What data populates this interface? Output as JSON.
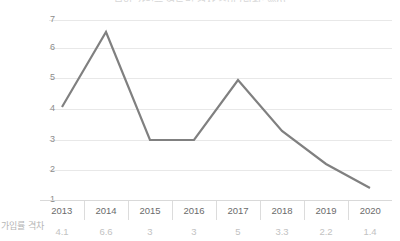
{
  "chart_data": {
    "type": "line",
    "title": "보험 가입률 연도별 격차 추이 (단위: %p)",
    "xlabel": "",
    "ylabel": "",
    "categories": [
      "2013",
      "2014",
      "2015",
      "2016",
      "2017",
      "2018",
      "2019",
      "2020"
    ],
    "series": [
      {
        "name": "가입률 격차",
        "values": [
          4.1,
          6.6,
          3,
          3,
          5,
          3.3,
          2.2,
          1.4
        ]
      }
    ],
    "value_labels": [
      "4.1",
      "6.6",
      "3",
      "3",
      "5",
      "3.3",
      "2.2",
      "1.4"
    ],
    "ylim": [
      1,
      7
    ],
    "yticks": [
      "7",
      "6",
      "5",
      "4",
      "3",
      "2",
      "1"
    ],
    "grid": true,
    "legend": "none",
    "line_color": "#808080",
    "grid_color": "#e8e8e8",
    "axis_text_color": "#8c8c8c",
    "value_text_color": "#c2c2c2"
  },
  "table": {
    "row_label": "가입률 격차"
  }
}
